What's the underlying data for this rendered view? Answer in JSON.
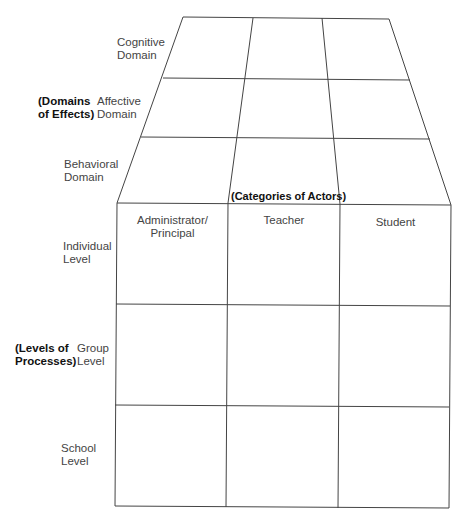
{
  "diagram": {
    "top_section": {
      "group_label": [
        "(Domains",
        "of Effects)"
      ],
      "rows": [
        {
          "label": [
            "Cognitive",
            "Domain"
          ]
        },
        {
          "label": [
            "Affective",
            "Domain"
          ]
        },
        {
          "label": [
            "Behavioral",
            "Domain"
          ]
        }
      ]
    },
    "front_section": {
      "column_group_label": "(Categories of Actors)",
      "columns": [
        {
          "label": [
            "Administrator/",
            "Principal"
          ]
        },
        {
          "label": [
            "Teacher"
          ]
        },
        {
          "label": [
            "Student"
          ]
        }
      ],
      "row_group_label": [
        "(Levels of",
        "Processes)"
      ],
      "rows": [
        {
          "label": [
            "Individual",
            "Level"
          ]
        },
        {
          "label": [
            "Group",
            "Level"
          ]
        },
        {
          "label": [
            "School",
            "Level"
          ]
        }
      ]
    },
    "colors": {
      "line": "#444444",
      "text": "#444444",
      "bold_text": "#111111",
      "background": "#ffffff"
    }
  }
}
